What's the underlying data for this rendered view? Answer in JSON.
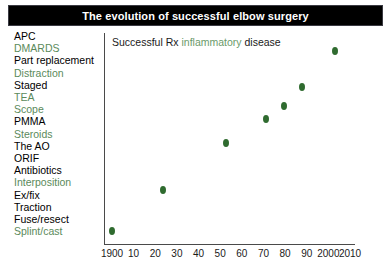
{
  "title": "The evolution of successful elbow surgery",
  "annotation": {
    "prefix": "Successful Rx ",
    "highlight": "inflammatory",
    "suffix": " disease"
  },
  "colors": {
    "title_bar": "#000000",
    "title_text": "#ffffff",
    "label_black": "#000000",
    "label_green": "#5b8a5b",
    "datapoint_green": "#2f6b2f",
    "axis": "#4a4a4a"
  },
  "labels": [
    {
      "text": "APC",
      "color": "black"
    },
    {
      "text": "DMARDS",
      "color": "green"
    },
    {
      "text": "Part replacement",
      "color": "black"
    },
    {
      "text": "Distraction",
      "color": "green"
    },
    {
      "text": "Staged",
      "color": "black"
    },
    {
      "text": "TEA",
      "color": "green"
    },
    {
      "text": "Scope",
      "color": "green"
    },
    {
      "text": "PMMA",
      "color": "black"
    },
    {
      "text": "Steroids",
      "color": "green"
    },
    {
      "text": "The AO",
      "color": "black"
    },
    {
      "text": "ORIF",
      "color": "black"
    },
    {
      "text": "Antibiotics",
      "color": "black"
    },
    {
      "text": "Interposition",
      "color": "green"
    },
    {
      "text": "Ex/fix",
      "color": "black"
    },
    {
      "text": "Traction",
      "color": "black"
    },
    {
      "text": "Fuse/resect",
      "color": "black"
    },
    {
      "text": "Splint/cast",
      "color": "green"
    }
  ],
  "chart_data": {
    "type": "scatter",
    "title": "The evolution of successful elbow surgery",
    "xlabel": "",
    "ylabel": "",
    "grid": false,
    "legend": false,
    "xlim": [
      1900,
      2010
    ],
    "ylim": [
      0,
      17
    ],
    "x_tick_labels": [
      "1900",
      "10",
      "20",
      "30",
      "40",
      "50",
      "60",
      "70",
      "80",
      "90",
      "2000",
      "2010"
    ],
    "x_tick_values": [
      1900,
      1910,
      1920,
      1930,
      1940,
      1950,
      1960,
      1970,
      1980,
      1990,
      2000,
      2010
    ],
    "y_tick_labels": [],
    "annotation": "Successful Rx inflammatory disease",
    "series": [
      {
        "name": "Successful Rx inflammatory disease",
        "color": "#2f6b2f",
        "points": [
          {
            "x": 1900,
            "y": 0.6,
            "px": 112,
            "py": 231
          },
          {
            "x": 1923,
            "y": 4.1,
            "px": 163,
            "py": 190
          },
          {
            "x": 1951,
            "y": 8.1,
            "px": 226,
            "py": 143
          },
          {
            "x": 1969,
            "y": 10.2,
            "px": 266,
            "py": 119
          },
          {
            "x": 1977,
            "y": 11.3,
            "px": 284,
            "py": 106
          },
          {
            "x": 1985,
            "y": 12.9,
            "px": 302,
            "py": 87
          },
          {
            "x": 2000,
            "y": 16.1,
            "px": 335,
            "py": 51
          }
        ]
      }
    ]
  }
}
